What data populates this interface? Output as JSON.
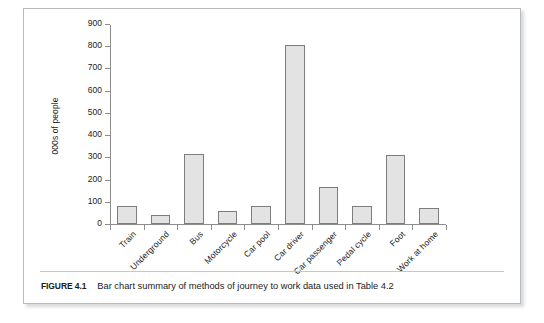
{
  "figure": {
    "caption_label": "FIGURE 4.1",
    "caption_text": "Bar chart summary of methods of journey to work data used in Table 4.2"
  },
  "colors": {
    "bar_fill": "#e3e3e3",
    "bar_stroke": "#7d7d7d",
    "axis": "#8d8d8d",
    "text": "#1b1b1b",
    "frame": "#b9bcbe"
  },
  "chart_data": {
    "type": "bar",
    "title": "",
    "xlabel": "",
    "ylabel": "000s of people",
    "ylim": [
      0,
      900
    ],
    "yticks": [
      0,
      100,
      200,
      300,
      400,
      500,
      600,
      700,
      800,
      900
    ],
    "grid": false,
    "legend": null,
    "categories": [
      "Train",
      "Underground",
      "Bus",
      "Motorcycle",
      "Car pool",
      "Car driver",
      "Car passenger",
      "Pedal cycle",
      "Foot",
      "Work at home"
    ],
    "values": [
      80,
      42,
      313,
      60,
      82,
      805,
      165,
      80,
      310,
      73
    ]
  }
}
